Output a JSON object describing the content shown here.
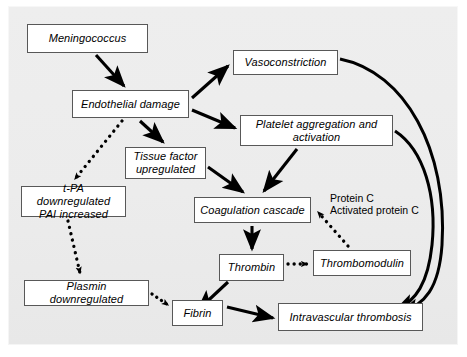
{
  "figure": {
    "background_color": "#ececec",
    "node_fill": "#ffffff",
    "node_border": "#585858",
    "edge_color": "#000000"
  },
  "nodes": [
    {
      "id": "meningococcus",
      "label": "Meningococcus",
      "x": 27,
      "y": 24,
      "w": 121,
      "h": 29
    },
    {
      "id": "endothelial",
      "label": "Endothelial damage",
      "x": 72,
      "y": 90,
      "w": 117,
      "h": 28
    },
    {
      "id": "vasoconstrict",
      "label": "Vasoconstriction",
      "x": 233,
      "y": 50,
      "w": 105,
      "h": 25
    },
    {
      "id": "platelet",
      "label": "Platelet aggregation and\nactivation",
      "x": 240,
      "y": 115,
      "w": 153,
      "h": 31
    },
    {
      "id": "tissuefactor",
      "label": "Tissue factor\nupregulated",
      "x": 125,
      "y": 147,
      "w": 81,
      "h": 32
    },
    {
      "id": "tpa",
      "label": "t-PA downregulated\nPAI increased",
      "x": 21,
      "y": 186,
      "w": 105,
      "h": 31
    },
    {
      "id": "coagulation",
      "label": "Coagulation cascade",
      "x": 194,
      "y": 197,
      "w": 117,
      "h": 26
    },
    {
      "id": "thrombin",
      "label": "Thrombin",
      "x": 219,
      "y": 254,
      "w": 65,
      "h": 27
    },
    {
      "id": "thrombomodulin",
      "label": "Thrombomodulin",
      "x": 313,
      "y": 250,
      "w": 98,
      "h": 26
    },
    {
      "id": "plasmin",
      "label": "Plasmin downregulated",
      "x": 24,
      "y": 280,
      "w": 125,
      "h": 26
    },
    {
      "id": "fibrin",
      "label": "Fibrin",
      "x": 172,
      "y": 300,
      "w": 51,
      "h": 26
    },
    {
      "id": "thrombosis",
      "label": "Intravascular thrombosis",
      "x": 278,
      "y": 303,
      "w": 145,
      "h": 28
    }
  ],
  "free_labels": [
    {
      "id": "protein-c",
      "text": "Protein C\nActivated protein C",
      "x": 330,
      "y": 192
    }
  ],
  "edges": [
    {
      "from": "meningococcus",
      "to": "endothelial",
      "style": "solid"
    },
    {
      "from": "endothelial",
      "to": "vasoconstrict",
      "style": "solid"
    },
    {
      "from": "endothelial",
      "to": "platelet",
      "style": "solid"
    },
    {
      "from": "endothelial",
      "to": "tissuefactor",
      "style": "solid"
    },
    {
      "from": "endothelial",
      "to": "tpa",
      "style": "dotted"
    },
    {
      "from": "tissuefactor",
      "to": "coagulation",
      "style": "solid"
    },
    {
      "from": "platelet",
      "to": "coagulation",
      "style": "solid"
    },
    {
      "from": "coagulation",
      "to": "thrombin",
      "style": "solid"
    },
    {
      "from": "thrombin",
      "to": "thrombomodulin",
      "style": "dotted"
    },
    {
      "from": "thrombomodulin",
      "to": "coagulation",
      "style": "dotted",
      "note": "Protein C / Activated protein C"
    },
    {
      "from": "thrombin",
      "to": "fibrin",
      "style": "solid"
    },
    {
      "from": "tpa",
      "to": "plasmin",
      "style": "dotted"
    },
    {
      "from": "plasmin",
      "to": "fibrin",
      "style": "dotted"
    },
    {
      "from": "fibrin",
      "to": "thrombosis",
      "style": "solid"
    },
    {
      "from": "vasoconstrict",
      "to": "thrombosis",
      "style": "solid-curve"
    },
    {
      "from": "platelet",
      "to": "thrombosis",
      "style": "solid-curve"
    }
  ]
}
